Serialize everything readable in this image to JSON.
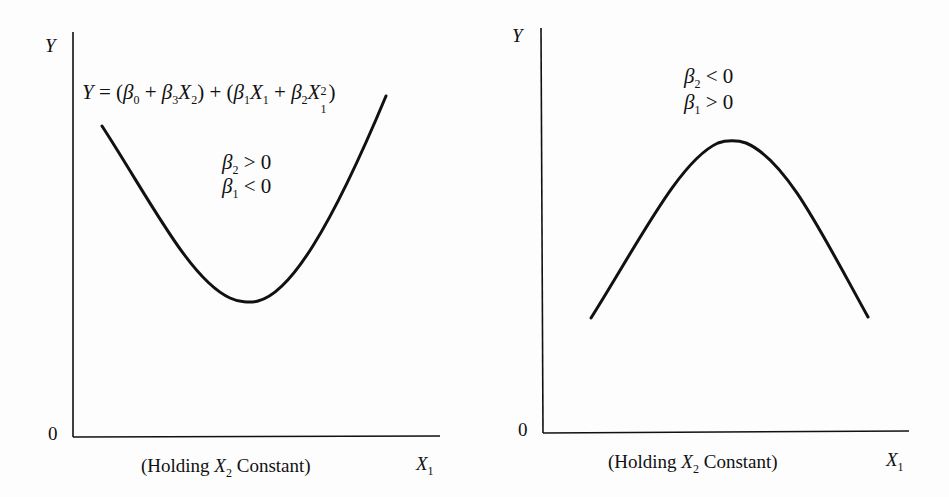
{
  "left_panel": {
    "y_axis_label": "Y",
    "origin_label": "0",
    "x_axis_label": "X",
    "x_axis_sub": "1",
    "caption_pre": "(Holding ",
    "caption_var": "X",
    "caption_sub": "2",
    "caption_post": " Constant)",
    "equation": {
      "lhs": "Y",
      "eq": " = (",
      "b0": "β",
      "b0_sub": "0",
      "plus1": " + ",
      "b3": "β",
      "b3_sub": "3",
      "x2": "X",
      "x2_sub": "2",
      "close1": ") + (",
      "b1": "β",
      "b1_sub": "1",
      "x1a": "X",
      "x1a_sub": "1",
      "plus2": " + ",
      "b2": "β",
      "b2_sub": "2",
      "x1b": "X",
      "x1b_sub": "1",
      "x1b_sup": "2",
      "close2": ")"
    },
    "cond1": {
      "sym": "β",
      "sub": "2",
      "rel": " > 0"
    },
    "cond2": {
      "sym": "β",
      "sub": "1",
      "rel": " < 0"
    },
    "curve_shape": "U-shaped (convex) parabola"
  },
  "right_panel": {
    "y_axis_label": "Y",
    "origin_label": "0",
    "x_axis_label": "X",
    "x_axis_sub": "1",
    "caption_pre": "(Holding ",
    "caption_var": "X",
    "caption_sub": "2",
    "caption_post": " Constant)",
    "cond1": {
      "sym": "β",
      "sub": "2",
      "rel": " < 0"
    },
    "cond2": {
      "sym": "β",
      "sub": "1",
      "rel": " > 0"
    },
    "curve_shape": "inverted-U (concave) parabola"
  },
  "colors": {
    "ink": "#111111",
    "paper": "#fdfdfd"
  }
}
